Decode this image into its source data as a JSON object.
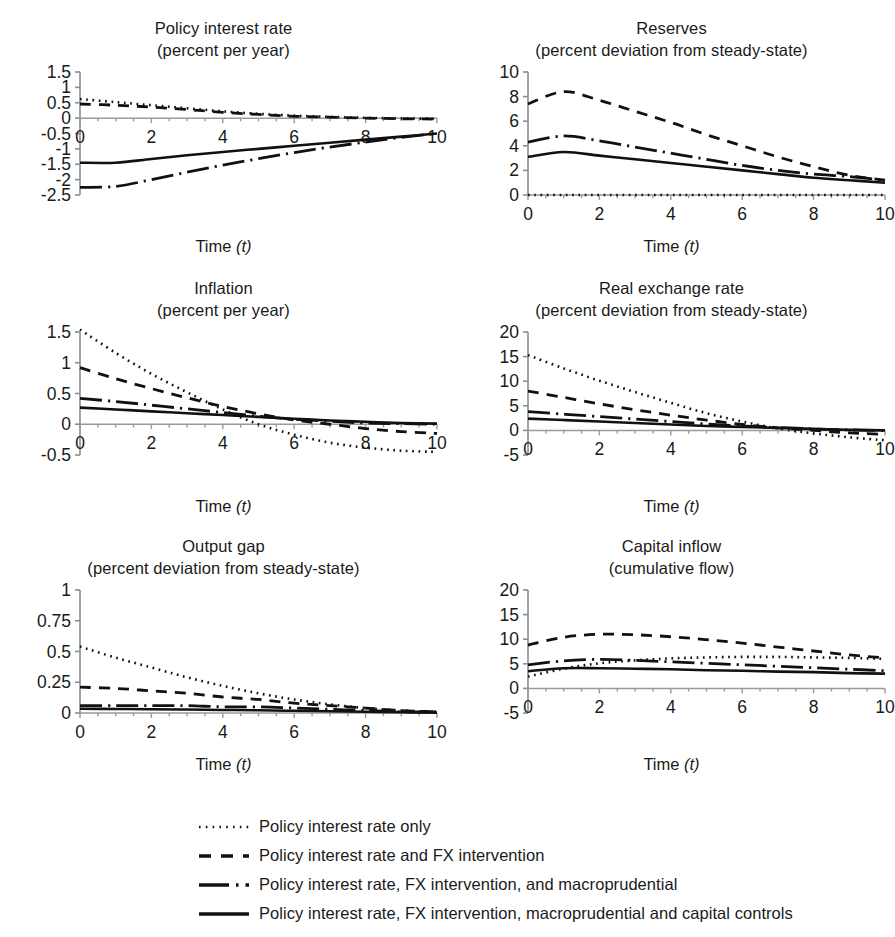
{
  "figure": {
    "x_axis_label_main": "Time",
    "x_axis_label_italic": "(t)"
  },
  "legend": {
    "position": "bottom",
    "items": [
      {
        "label": "Policy interest rate only",
        "style": "dotted",
        "key": "dotted-line-key"
      },
      {
        "label": "Policy interest rate and FX intervention",
        "style": "dashed",
        "key": "dashed-line-key"
      },
      {
        "label": "Policy interest rate, FX intervention, and macroprudential",
        "style": "dashdot",
        "key": "dashdot-line-key"
      },
      {
        "label": "Policy interest rate, FX intervention, macroprudential and capital controls",
        "style": "solid",
        "key": "solid-line-key"
      }
    ]
  },
  "chart_data": [
    {
      "id": "policy-interest-rate",
      "type": "line",
      "title": "Policy interest rate",
      "subtitle": "(percent per year)",
      "xlabel": "Time (t)",
      "ylabel": "",
      "grid": false,
      "xlim": [
        0,
        10
      ],
      "ylim": [
        -2.5,
        1.5
      ],
      "xticks": [
        0,
        2,
        4,
        6,
        8,
        10
      ],
      "xticklabels": [
        "0",
        "2",
        "4",
        "6",
        "8",
        "10"
      ],
      "yticks": [
        1.5,
        1,
        0.5,
        0,
        -0.5,
        -1,
        -1.5,
        -2,
        -2.5
      ],
      "yticklabels": [
        "1.5",
        "1",
        "0.5",
        "0",
        "-0.5",
        "-1",
        "-1.5",
        "-2",
        "-2.5"
      ],
      "x": [
        0,
        1,
        2,
        3,
        4,
        5,
        6,
        7,
        8,
        9,
        10
      ],
      "series": [
        {
          "name": "Policy interest rate only",
          "style": "dotted",
          "values": [
            0.62,
            0.52,
            0.42,
            0.32,
            0.22,
            0.14,
            0.08,
            0.04,
            0.01,
            -0.01,
            -0.02
          ]
        },
        {
          "name": "Policy interest rate and FX intervention",
          "style": "dashed",
          "values": [
            0.46,
            0.42,
            0.36,
            0.28,
            0.19,
            0.12,
            0.06,
            0.03,
            0.0,
            -0.02,
            -0.03
          ]
        },
        {
          "name": "Policy interest rate, FX intervention, and macroprudential",
          "style": "dashdot",
          "values": [
            -2.25,
            -2.22,
            -2.0,
            -1.76,
            -1.53,
            -1.32,
            -1.12,
            -0.94,
            -0.78,
            -0.63,
            -0.5
          ]
        },
        {
          "name": "Policy interest rate, FX intervention, macroprudential and capital controls",
          "style": "solid",
          "values": [
            -1.45,
            -1.45,
            -1.33,
            -1.21,
            -1.1,
            -1.0,
            -0.9,
            -0.8,
            -0.7,
            -0.6,
            -0.5
          ]
        }
      ]
    },
    {
      "id": "reserves",
      "type": "line",
      "title": "Reserves",
      "subtitle": "(percent deviation from steady-state)",
      "xlabel": "Time (t)",
      "ylabel": "",
      "grid": false,
      "xlim": [
        0,
        10
      ],
      "ylim": [
        0,
        10
      ],
      "xticks": [
        0,
        2,
        4,
        6,
        8,
        10
      ],
      "xticklabels": [
        "0",
        "2",
        "4",
        "6",
        "8",
        "10"
      ],
      "yticks": [
        10,
        8,
        6,
        4,
        2,
        0
      ],
      "yticklabels": [
        "10",
        "8",
        "6",
        "4",
        "2",
        "0"
      ],
      "x": [
        0,
        1,
        2,
        3,
        4,
        5,
        6,
        7,
        8,
        9,
        10
      ],
      "series": [
        {
          "name": "Policy interest rate only",
          "style": "dotted",
          "values": [
            0,
            0,
            0,
            0,
            0,
            0,
            0,
            0,
            0,
            0,
            0
          ]
        },
        {
          "name": "Policy interest rate and FX intervention",
          "style": "dashed",
          "values": [
            7.4,
            8.4,
            7.7,
            6.8,
            5.9,
            4.9,
            4.0,
            3.1,
            2.3,
            1.6,
            1.2
          ]
        },
        {
          "name": "Policy interest rate, FX intervention, and macroprudential",
          "style": "dashdot",
          "values": [
            4.3,
            4.8,
            4.4,
            3.9,
            3.4,
            2.9,
            2.4,
            2.0,
            1.7,
            1.5,
            1.2
          ]
        },
        {
          "name": "Policy interest rate, FX intervention, macroprudential and capital controls",
          "style": "solid",
          "values": [
            3.1,
            3.5,
            3.2,
            2.9,
            2.6,
            2.3,
            2.0,
            1.7,
            1.4,
            1.2,
            1.0
          ]
        }
      ]
    },
    {
      "id": "inflation",
      "type": "line",
      "title": "Inflation",
      "subtitle": "(percent per year)",
      "xlabel": "Time (t)",
      "ylabel": "",
      "grid": false,
      "xlim": [
        0,
        10
      ],
      "ylim": [
        -0.5,
        1.5
      ],
      "xticks": [
        0,
        2,
        4,
        6,
        8,
        10
      ],
      "xticklabels": [
        "0",
        "2",
        "4",
        "6",
        "8",
        "10"
      ],
      "yticks": [
        1.5,
        1,
        0.5,
        0,
        -0.5
      ],
      "yticklabels": [
        "1.5",
        "1",
        "0.5",
        "0",
        "-0.5"
      ],
      "x": [
        0,
        1,
        2,
        3,
        4,
        5,
        6,
        7,
        8,
        9,
        10
      ],
      "series": [
        {
          "name": "Policy interest rate only",
          "style": "dotted",
          "values": [
            1.54,
            1.16,
            0.82,
            0.52,
            0.24,
            0.0,
            -0.17,
            -0.3,
            -0.38,
            -0.43,
            -0.45
          ]
        },
        {
          "name": "Policy interest rate and FX intervention",
          "style": "dashed",
          "values": [
            0.92,
            0.74,
            0.58,
            0.43,
            0.29,
            0.17,
            0.07,
            0.0,
            -0.07,
            -0.12,
            -0.15
          ]
        },
        {
          "name": "Policy interest rate, FX intervention, and macroprudential",
          "style": "dashdot",
          "values": [
            0.42,
            0.37,
            0.31,
            0.25,
            0.19,
            0.13,
            0.08,
            0.05,
            0.02,
            0.01,
            0.0
          ]
        },
        {
          "name": "Policy interest rate, FX intervention, macroprudential and capital controls",
          "style": "solid",
          "values": [
            0.27,
            0.24,
            0.21,
            0.18,
            0.15,
            0.12,
            0.09,
            0.06,
            0.04,
            0.02,
            0.01
          ]
        }
      ]
    },
    {
      "id": "real-exchange-rate",
      "type": "line",
      "title": "Real exchange rate",
      "subtitle": "(percent deviation from steady-state)",
      "xlabel": "Time (t)",
      "ylabel": "",
      "grid": false,
      "xlim": [
        0,
        10
      ],
      "ylim": [
        -5,
        20
      ],
      "xticks": [
        0,
        2,
        4,
        6,
        8,
        10
      ],
      "xticklabels": [
        "0",
        "2",
        "4",
        "6",
        "8",
        "10"
      ],
      "yticks": [
        20,
        15,
        10,
        5,
        0,
        -5
      ],
      "yticklabels": [
        "20",
        "15",
        "10",
        "5",
        "0",
        "-5"
      ],
      "x": [
        0,
        1,
        2,
        3,
        4,
        5,
        6,
        7,
        8,
        9,
        10
      ],
      "series": [
        {
          "name": "Policy interest rate only",
          "style": "dotted",
          "values": [
            15.3,
            12.6,
            10.1,
            7.8,
            5.6,
            3.5,
            1.8,
            0.4,
            -0.6,
            -1.4,
            -2.0
          ]
        },
        {
          "name": "Policy interest rate and FX intervention",
          "style": "dashed",
          "values": [
            8.0,
            6.7,
            5.4,
            4.2,
            3.1,
            2.1,
            1.2,
            0.5,
            0.0,
            -0.5,
            -0.8
          ]
        },
        {
          "name": "Policy interest rate, FX intervention, and macroprudential",
          "style": "dashdot",
          "values": [
            3.8,
            3.3,
            2.8,
            2.3,
            1.8,
            1.3,
            0.9,
            0.6,
            0.3,
            0.1,
            0.0
          ]
        },
        {
          "name": "Policy interest rate, FX intervention, macroprudential and capital controls",
          "style": "solid",
          "values": [
            2.4,
            2.1,
            1.8,
            1.5,
            1.2,
            0.9,
            0.7,
            0.5,
            0.3,
            0.1,
            0.0
          ]
        }
      ]
    },
    {
      "id": "output-gap",
      "type": "line",
      "title": "Output gap",
      "subtitle": "(percent deviation from steady-state)",
      "xlabel": "Time (t)",
      "ylabel": "",
      "grid": false,
      "xlim": [
        0,
        10
      ],
      "ylim": [
        0,
        1
      ],
      "xticks": [
        0,
        2,
        4,
        6,
        8,
        10
      ],
      "xticklabels": [
        "0",
        "2",
        "4",
        "6",
        "8",
        "10"
      ],
      "yticks": [
        1,
        0.75,
        0.5,
        0.25,
        0
      ],
      "yticklabels": [
        "1",
        "0.75",
        "0.5",
        "0.25",
        "0"
      ],
      "x": [
        0,
        1,
        2,
        3,
        4,
        5,
        6,
        7,
        8,
        9,
        10
      ],
      "series": [
        {
          "name": "Policy interest rate only",
          "style": "dotted",
          "values": [
            0.54,
            0.45,
            0.37,
            0.29,
            0.22,
            0.16,
            0.11,
            0.07,
            0.04,
            0.02,
            0.01
          ]
        },
        {
          "name": "Policy interest rate and FX intervention",
          "style": "dashed",
          "values": [
            0.21,
            0.2,
            0.18,
            0.16,
            0.13,
            0.11,
            0.08,
            0.06,
            0.04,
            0.02,
            0.01
          ]
        },
        {
          "name": "Policy interest rate, FX intervention, and macroprudential",
          "style": "dashdot",
          "values": [
            0.06,
            0.06,
            0.06,
            0.06,
            0.05,
            0.05,
            0.04,
            0.03,
            0.02,
            0.01,
            0.01
          ]
        },
        {
          "name": "Policy interest rate, FX intervention, macroprudential and capital controls",
          "style": "solid",
          "values": [
            0.035,
            0.033,
            0.031,
            0.028,
            0.025,
            0.022,
            0.018,
            0.014,
            0.01,
            0.006,
            0.003
          ]
        }
      ]
    },
    {
      "id": "capital-inflow",
      "type": "line",
      "title": "Capital inflow",
      "subtitle": "(cumulative flow)",
      "xlabel": "Time (t)",
      "ylabel": "",
      "grid": false,
      "xlim": [
        0,
        10
      ],
      "ylim": [
        -5,
        20
      ],
      "xticks": [
        0,
        2,
        4,
        6,
        8,
        10
      ],
      "xticklabels": [
        "0",
        "2",
        "4",
        "6",
        "8",
        "10"
      ],
      "yticks": [
        20,
        15,
        10,
        5,
        0,
        -5
      ],
      "yticklabels": [
        "20",
        "15",
        "10",
        "5",
        "0",
        "-5"
      ],
      "x": [
        0,
        1,
        2,
        3,
        4,
        5,
        6,
        7,
        8,
        9,
        10
      ],
      "series": [
        {
          "name": "Policy interest rate only",
          "style": "dotted",
          "values": [
            2.4,
            4.0,
            5.1,
            5.7,
            6.1,
            6.3,
            6.4,
            6.4,
            6.3,
            6.2,
            6.0
          ]
        },
        {
          "name": "Policy interest rate and FX intervention",
          "style": "dashed",
          "values": [
            8.8,
            10.4,
            11.0,
            10.9,
            10.5,
            9.9,
            9.2,
            8.4,
            7.6,
            6.8,
            6.2
          ]
        },
        {
          "name": "Policy interest rate, FX intervention, and macroprudential",
          "style": "dashdot",
          "values": [
            4.8,
            5.6,
            5.9,
            5.7,
            5.4,
            5.1,
            4.8,
            4.5,
            4.2,
            3.9,
            3.6
          ]
        },
        {
          "name": "Policy interest rate, FX intervention, macroprudential and capital controls",
          "style": "solid",
          "values": [
            3.5,
            4.1,
            4.1,
            4.0,
            3.9,
            3.7,
            3.6,
            3.4,
            3.3,
            3.1,
            3.0
          ]
        }
      ]
    }
  ]
}
